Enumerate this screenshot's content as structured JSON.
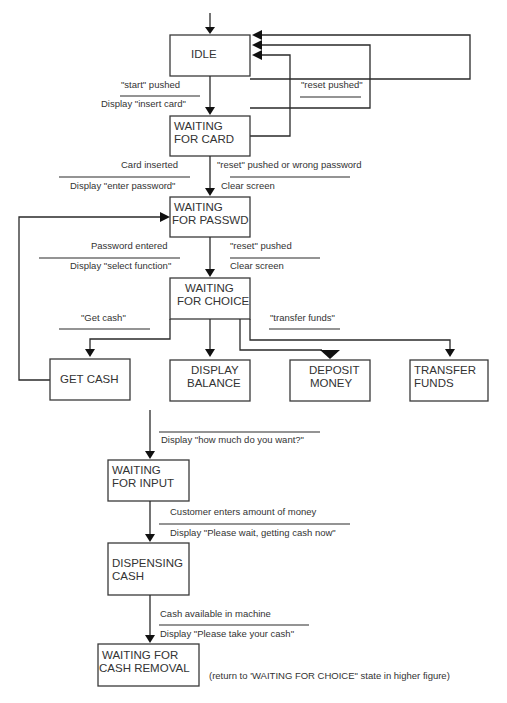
{
  "states": {
    "idle": {
      "lines": [
        "IDLE"
      ]
    },
    "waiting_card": {
      "lines": [
        "WAITING",
        "FOR CARD"
      ]
    },
    "waiting_passwd": {
      "lines": [
        "WAITING",
        "FOR PASSWD"
      ]
    },
    "waiting_choice": {
      "lines": [
        "WAITING",
        "FOR CHOICE"
      ]
    },
    "get_cash": {
      "lines": [
        "GET CASH"
      ]
    },
    "display_balance": {
      "lines": [
        "DISPLAY",
        "BALANCE"
      ]
    },
    "deposit_money": {
      "lines": [
        "DEPOSIT",
        "MONEY"
      ]
    },
    "transfer_funds": {
      "lines": [
        "TRANSFER",
        "FUNDS"
      ]
    },
    "waiting_input": {
      "lines": [
        "WAITING",
        "FOR INPUT"
      ]
    },
    "dispensing_cash": {
      "lines": [
        "DISPENSING",
        "CASH"
      ]
    },
    "waiting_removal": {
      "lines": [
        "WAITING FOR",
        "CASH REMOVAL"
      ]
    }
  },
  "transitions": {
    "start": {
      "event": "\"start\" pushed",
      "action": "Display \"insert card\""
    },
    "reset_idle": {
      "event": "\"reset pushed\""
    },
    "card_inserted": {
      "event": "Card inserted",
      "action": "Display \"enter password\""
    },
    "reset_wrong": {
      "event": "\"reset\" pushed or wrong password",
      "action": "Clear screen"
    },
    "password_entered": {
      "event": "Password entered",
      "action": "Display \"select function\""
    },
    "reset_choice": {
      "event": "\"reset\" pushed",
      "action": "Clear screen"
    },
    "get_cash": {
      "event": "\"Get cash\""
    },
    "transfer_funds": {
      "event": "\"transfer funds\""
    },
    "how_much": {
      "action": "Display \"how much do you want?\""
    },
    "enters_amount": {
      "event": "Customer enters amount of money",
      "action": "Display \"Please wait, getting cash now\""
    },
    "cash_available": {
      "event": "Cash available in machine",
      "action": "Display \"Please take your cash\""
    }
  },
  "note": "(return to 'WAITING FOR CHOICE\" state in higher figure)"
}
